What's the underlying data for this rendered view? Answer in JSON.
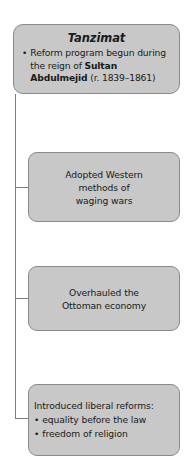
{
  "diagram": {
    "type": "hierarchy-flowchart",
    "root": {
      "title": "Tanzimat",
      "bullet_marker": "•",
      "bullet_text_plain": "Reform program begun during the reign of Sultan Abdulmejid (r. 1839–1861)",
      "bullet_segments": {
        "lead": "Reform program begun during the reign of ",
        "bold": "Sultan Abdulmejid",
        "tail": " (r. 1839–1861)"
      }
    },
    "children": [
      {
        "lines": [
          "Adopted Western",
          "methods of",
          "waging wars"
        ]
      },
      {
        "lines": [
          "Overhauled the",
          "Ottoman economy"
        ]
      },
      {
        "heading": "Introduced liberal reforms:",
        "bullet_marker": "•",
        "bullets": [
          "equality before the law",
          "freedom of religion"
        ]
      }
    ],
    "colors": {
      "box_fill": "#c8c8c8",
      "box_border": "#8a8a8a",
      "connector": "#7d7d7d",
      "text": "#1a1a1a",
      "background": "#ffffff"
    }
  }
}
